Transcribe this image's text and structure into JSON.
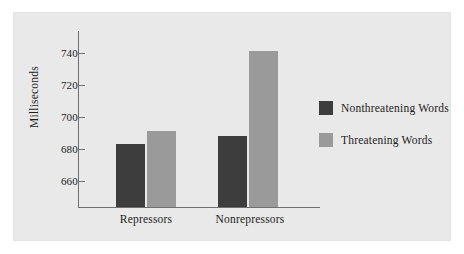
{
  "chart_data": {
    "type": "bar",
    "title": "",
    "subtitle": "",
    "xlabel": "",
    "ylabel": "Milliseconds",
    "categories": [
      "Repressors",
      "Nonrepressors"
    ],
    "series": [
      {
        "name": "Nonthreatening Words",
        "values": [
          683,
          688
        ],
        "color": "#3d3d3d"
      },
      {
        "name": "Threatening Words",
        "values": [
          691,
          741
        ],
        "color": "#9a9a9a"
      }
    ],
    "ylim": [
      652,
      748
    ],
    "yticks": [
      660,
      680,
      700,
      720,
      740
    ],
    "ytick_labels": [
      "660",
      "680",
      "700",
      "720",
      "740"
    ],
    "grid": false,
    "legend_position": "right",
    "background_color": "#e9e9e9",
    "axis_color": "#6f6f6f",
    "text_color": "#1c1c1c"
  },
  "axis": {
    "y_title": "Milliseconds",
    "ticks": [
      {
        "label": "740"
      },
      {
        "label": "720"
      },
      {
        "label": "700"
      },
      {
        "label": "680"
      },
      {
        "label": "660"
      }
    ]
  },
  "categories": [
    {
      "label": "Repressors"
    },
    {
      "label": "Nonrepressors"
    }
  ],
  "legend": {
    "items": [
      {
        "label": "Nonthreatening Words",
        "color": "#3d3d3d"
      },
      {
        "label": "Threatening Words",
        "color": "#9a9a9a"
      }
    ]
  }
}
